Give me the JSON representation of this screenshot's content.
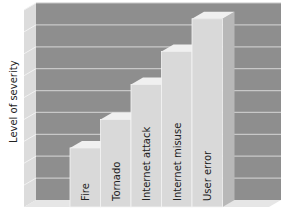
{
  "chart_data": {
    "type": "bar",
    "style": "3d",
    "title": "",
    "xlabel": "",
    "ylabel": "Level of severity",
    "categories": [
      "Fire",
      "Tornado",
      "Internet attack",
      "Internet misuse",
      "User error"
    ],
    "values": [
      2.7,
      4.0,
      5.6,
      7.1,
      8.6
    ],
    "ylim": [
      0,
      9
    ],
    "grid": true,
    "gridline_count": 9,
    "tick_labels_shown": false,
    "legend": "none",
    "colors": {
      "back_wall": "#8e8e8e",
      "side_wall": "#dcdcdc",
      "floor": "#e6e6e6",
      "gridline": "#c8c8c8",
      "bar_front": "#d9d9d9",
      "bar_side": "#b8b8b8",
      "bar_top": "#f0f0f0"
    }
  }
}
